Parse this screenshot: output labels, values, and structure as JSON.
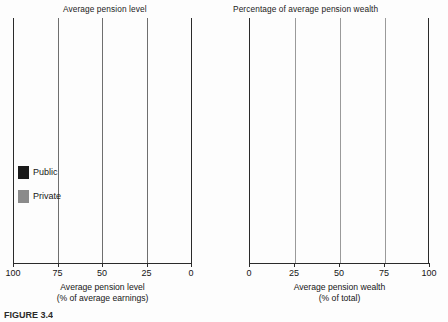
{
  "figure": {
    "caption": "FIGURE 3.4"
  },
  "legend": {
    "items": [
      {
        "key": "public",
        "label": "Public",
        "color": "#1a1a1a"
      },
      {
        "key": "private",
        "label": "Private",
        "color": "#8b8b8b"
      }
    ]
  },
  "panels": {
    "left": {
      "title": "Average pension level",
      "axis_caption_line1": "Average pension level",
      "axis_caption_line2": "(% of average earnings)",
      "ticks": [
        "100",
        "75",
        "50",
        "25",
        "0"
      ]
    },
    "right": {
      "title": "Percentage of average pension wealth",
      "axis_caption_line1": "Average pension wealth",
      "axis_caption_line2": "(% of total)",
      "ticks": [
        "0",
        "25",
        "50",
        "75",
        "100"
      ]
    }
  },
  "countries": [
    "Hungary",
    "Sweden",
    "Poland",
    "Slovak Republic",
    "Mexico"
  ],
  "period_labels": {
    "before": "Before",
    "after": "After"
  },
  "chart_data": [
    {
      "type": "bar",
      "id": "average-pension-level",
      "title": "Average pension level",
      "xlabel": "Average pension level (% of average earnings)",
      "ylabel": "",
      "orientation": "horizontal",
      "stacked": true,
      "xlim": [
        0,
        100
      ],
      "x_axis_reversed": true,
      "xticks": [
        100,
        75,
        50,
        25,
        0
      ],
      "grid": true,
      "legend_position": "left",
      "categories": [
        "Hungary Before",
        "Hungary After",
        "Sweden Before",
        "Sweden After",
        "Poland Before",
        "Poland After",
        "Slovak Republic Before",
        "Slovak Republic After",
        "Mexico Before",
        "Mexico After"
      ],
      "series": [
        {
          "name": "Public",
          "color": "#1a1a1a",
          "values": [
            65,
            48,
            53,
            35,
            61,
            30,
            50,
            25,
            73,
            5
          ]
        },
        {
          "name": "Private",
          "color": "#8b8b8b",
          "values": [
            0,
            25,
            23,
            32,
            0,
            30,
            0,
            32,
            0,
            32
          ]
        }
      ],
      "totals": [
        65,
        73,
        76,
        67,
        61,
        60,
        50,
        57,
        73,
        37
      ]
    },
    {
      "type": "bar",
      "id": "percentage-of-average-pension-wealth",
      "title": "Percentage of average pension wealth",
      "xlabel": "Average pension wealth (% of total)",
      "ylabel": "",
      "orientation": "horizontal",
      "stacked": true,
      "xlim": [
        0,
        100
      ],
      "x_axis_reversed": false,
      "xticks": [
        0,
        25,
        50,
        75,
        100
      ],
      "grid": true,
      "legend_position": "left",
      "categories": [
        "Hungary Before",
        "Hungary After",
        "Sweden Before",
        "Sweden After",
        "Poland Before",
        "Poland After",
        "Slovak Republic Before",
        "Slovak Republic After",
        "Mexico Before",
        "Mexico After"
      ],
      "series": [
        {
          "name": "Public",
          "color": "#1a1a1a",
          "values": [
            100,
            66,
            72,
            54,
            100,
            50,
            100,
            46,
            100,
            17
          ]
        },
        {
          "name": "Private",
          "color": "#8b8b8b",
          "values": [
            0,
            34,
            28,
            46,
            0,
            50,
            0,
            54,
            0,
            83
          ]
        }
      ],
      "totals": [
        100,
        100,
        100,
        100,
        100,
        100,
        100,
        100,
        100,
        100
      ]
    }
  ],
  "rows": [
    {
      "country": "Hungary",
      "period": "Before",
      "level_public": 65,
      "level_private": 0,
      "wealth_public": 100,
      "wealth_private": 0
    },
    {
      "country": "Hungary",
      "period": "After",
      "level_public": 48,
      "level_private": 25,
      "wealth_public": 66,
      "wealth_private": 34
    },
    {
      "country": "Sweden",
      "period": "Before",
      "level_public": 53,
      "level_private": 23,
      "wealth_public": 72,
      "wealth_private": 28
    },
    {
      "country": "Sweden",
      "period": "After",
      "level_public": 35,
      "level_private": 32,
      "wealth_public": 54,
      "wealth_private": 46
    },
    {
      "country": "Poland",
      "period": "Before",
      "level_public": 61,
      "level_private": 0,
      "wealth_public": 100,
      "wealth_private": 0
    },
    {
      "country": "Poland",
      "period": "After",
      "level_public": 30,
      "level_private": 30,
      "wealth_public": 50,
      "wealth_private": 50
    },
    {
      "country": "Slovak Republic",
      "period": "Before",
      "level_public": 50,
      "level_private": 0,
      "wealth_public": 100,
      "wealth_private": 0
    },
    {
      "country": "Slovak Republic",
      "period": "After",
      "level_public": 25,
      "level_private": 32,
      "wealth_public": 46,
      "wealth_private": 54
    },
    {
      "country": "Mexico",
      "period": "Before",
      "level_public": 73,
      "level_private": 0,
      "wealth_public": 100,
      "wealth_private": 0
    },
    {
      "country": "Mexico",
      "period": "After",
      "level_public": 5,
      "level_private": 32,
      "wealth_public": 17,
      "wealth_private": 83
    }
  ]
}
